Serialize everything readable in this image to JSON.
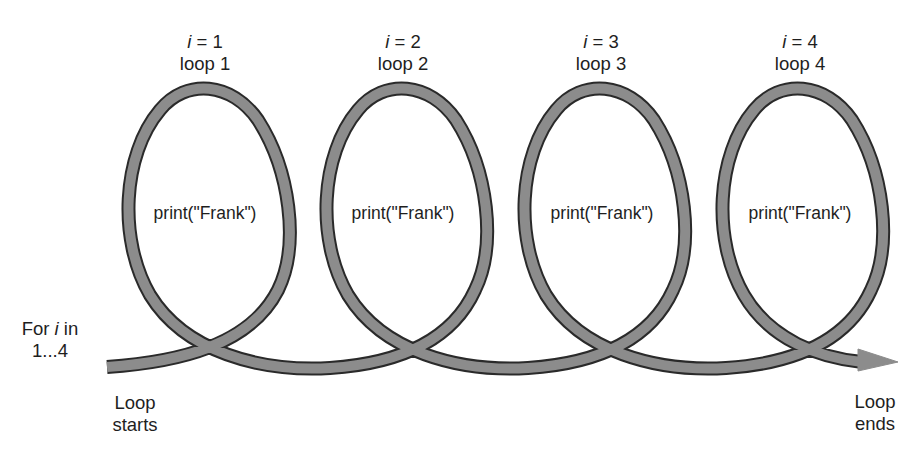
{
  "diagram": {
    "type": "for-loop-spiral",
    "start_label": {
      "line1_prefix": "For ",
      "line1_var": "i",
      "line1_suffix": " in",
      "line2": "1...4"
    },
    "loop_starts": {
      "line1": "Loop",
      "line2": "starts"
    },
    "loop_ends": {
      "line1": "Loop",
      "line2": "ends"
    },
    "loops": [
      {
        "var": "i",
        "eq": " = 1",
        "name": "loop 1",
        "body": "print(\"Frank\")"
      },
      {
        "var": "i",
        "eq": " = 2",
        "name": "loop 2",
        "body": "print(\"Frank\")"
      },
      {
        "var": "i",
        "eq": " = 3",
        "name": "loop 3",
        "body": "print(\"Frank\")"
      },
      {
        "var": "i",
        "eq": " = 4",
        "name": "loop 4",
        "body": "print(\"Frank\")"
      }
    ],
    "colors": {
      "stroke_fill": "#8c8c8c",
      "stroke_edge": "#2a2a2a",
      "text": "#1e1e1e",
      "background": "#ffffff"
    }
  }
}
